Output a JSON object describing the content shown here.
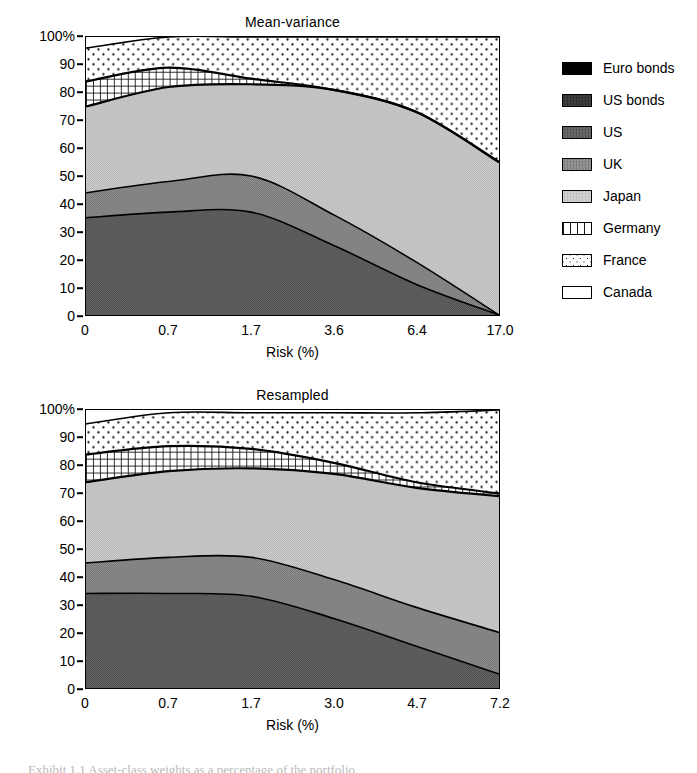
{
  "legend": {
    "items": [
      {
        "label": "Euro bonds",
        "key": "euro_bonds",
        "fill": "#000000",
        "pattern": "solid-black"
      },
      {
        "label": "US bonds",
        "key": "us_bonds",
        "fill": "#3a3a3a",
        "pattern": "dither-dark"
      },
      {
        "label": "US",
        "key": "us",
        "fill": "#666666",
        "pattern": "dither-mid-dark"
      },
      {
        "label": "UK",
        "key": "uk",
        "fill": "#8a8a8a",
        "pattern": "dither-mid"
      },
      {
        "label": "Japan",
        "key": "japan",
        "fill": "#c8c8c8",
        "pattern": "dither-light"
      },
      {
        "label": "Germany",
        "key": "germany",
        "fill": "#ffffff",
        "pattern": "vertical-grid"
      },
      {
        "label": "France",
        "key": "france",
        "fill": "#ffffff",
        "pattern": "dots"
      },
      {
        "label": "Canada",
        "key": "canada",
        "fill": "#ffffff",
        "pattern": "empty"
      }
    ]
  },
  "caption": {
    "text": "Exhibit 1.1  Asset-class weights as a percentage of the portfolio"
  },
  "chart_data": [
    {
      "type": "area",
      "id": "mean-variance",
      "title": "Mean-variance",
      "xlabel": "Risk (%)",
      "ylabel": "",
      "categories": [
        "0",
        "0.7",
        "1.7",
        "3.6",
        "6.4",
        "17.0"
      ],
      "x_tick_labels": [
        "0",
        "0.7",
        "1.7",
        "3.6",
        "6.4",
        "17.0"
      ],
      "y_tick_labels": [
        "0",
        "10",
        "20",
        "30",
        "40",
        "50",
        "60",
        "70",
        "80",
        "90",
        "100%"
      ],
      "ylim": [
        0,
        100
      ],
      "stacked": true,
      "grid": false,
      "legend_position": "right",
      "series": [
        {
          "name": "Euro bonds",
          "values": [
            0,
            0,
            0,
            0,
            0,
            0
          ]
        },
        {
          "name": "US bonds",
          "values": [
            0,
            0,
            0,
            0,
            0,
            0
          ]
        },
        {
          "name": "US",
          "values": [
            35,
            37,
            37,
            25,
            11,
            0
          ]
        },
        {
          "name": "UK",
          "values": [
            9,
            11,
            13,
            11,
            8,
            0
          ]
        },
        {
          "name": "Japan",
          "values": [
            31,
            34,
            33,
            45,
            54,
            55
          ]
        },
        {
          "name": "Germany",
          "values": [
            9,
            7,
            2,
            0,
            0,
            0
          ]
        },
        {
          "name": "France",
          "values": [
            12,
            11,
            15,
            19,
            27,
            45
          ]
        },
        {
          "name": "Canada",
          "values": [
            4,
            0,
            0,
            0,
            0,
            0
          ]
        }
      ],
      "cumulative_boundaries": {
        "us": [
          35,
          37,
          37,
          25,
          11,
          0
        ],
        "uk": [
          44,
          48,
          50,
          36,
          19,
          0
        ],
        "japan": [
          75,
          82,
          83,
          81,
          73,
          55
        ],
        "germany": [
          84,
          89,
          85,
          81,
          73,
          55
        ],
        "france": [
          96,
          100,
          100,
          100,
          100,
          100
        ],
        "canada": [
          100,
          100,
          100,
          100,
          100,
          100
        ]
      }
    },
    {
      "type": "area",
      "id": "resampled",
      "title": "Resampled",
      "xlabel": "Risk (%)",
      "ylabel": "",
      "categories": [
        "0",
        "0.7",
        "1.7",
        "3.0",
        "4.7",
        "7.2"
      ],
      "x_tick_labels": [
        "0",
        "0.7",
        "1.7",
        "3.0",
        "4.7",
        "7.2"
      ],
      "y_tick_labels": [
        "0",
        "10",
        "20",
        "30",
        "40",
        "50",
        "60",
        "70",
        "80",
        "90",
        "100%"
      ],
      "ylim": [
        0,
        100
      ],
      "stacked": true,
      "grid": false,
      "legend_position": "right",
      "series": [
        {
          "name": "Euro bonds",
          "values": [
            0,
            0,
            0,
            0,
            0,
            0
          ]
        },
        {
          "name": "US bonds",
          "values": [
            0,
            0,
            0,
            0,
            0,
            0
          ]
        },
        {
          "name": "US",
          "values": [
            34,
            34,
            33,
            25,
            15,
            5
          ]
        },
        {
          "name": "UK",
          "values": [
            11,
            13,
            14,
            14,
            14,
            15
          ]
        },
        {
          "name": "Japan",
          "values": [
            29,
            31,
            32,
            38,
            43,
            49
          ]
        },
        {
          "name": "Germany",
          "values": [
            10,
            9,
            7,
            4,
            2,
            1
          ]
        },
        {
          "name": "France",
          "values": [
            11,
            12,
            13,
            18,
            25,
            30
          ]
        },
        {
          "name": "Canada",
          "values": [
            5,
            1,
            1,
            1,
            1,
            0
          ]
        }
      ],
      "cumulative_boundaries": {
        "us": [
          34,
          34,
          33,
          25,
          15,
          5
        ],
        "uk": [
          45,
          47,
          47,
          39,
          29,
          20
        ],
        "japan": [
          74,
          78,
          79,
          77,
          72,
          69
        ],
        "germany": [
          84,
          87,
          86,
          81,
          74,
          70
        ],
        "france": [
          95,
          99,
          99,
          99,
          99,
          100
        ],
        "canada": [
          100,
          100,
          100,
          100,
          100,
          100
        ]
      }
    }
  ]
}
